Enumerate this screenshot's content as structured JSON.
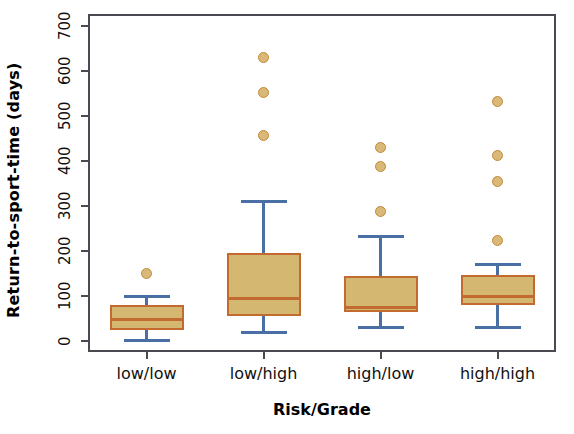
{
  "chart_data": {
    "type": "box",
    "title": "",
    "xlabel": "Risk/Grade",
    "ylabel": "Return-to-sport-time (days)",
    "ylim": [
      0,
      700
    ],
    "yticks": [
      0,
      100,
      200,
      300,
      400,
      500,
      600,
      700
    ],
    "ytick_labels": [
      "0",
      "100",
      "200",
      "300",
      "400",
      "500",
      "600",
      "700"
    ],
    "grid": false,
    "legend": "none",
    "categories": [
      "low/low",
      "low/high",
      "high/low",
      "high/high"
    ],
    "boxes": [
      {
        "category": "low/low",
        "whisker_low": 2,
        "q1": 25,
        "median": 47,
        "q3": 80,
        "whisker_high": 98,
        "outliers": [
          150
        ]
      },
      {
        "category": "low/high",
        "whisker_low": 18,
        "q1": 55,
        "median": 95,
        "q3": 195,
        "whisker_high": 310,
        "outliers": [
          456,
          552,
          630
        ]
      },
      {
        "category": "high/low",
        "whisker_low": 31,
        "q1": 65,
        "median": 75,
        "q3": 145,
        "whisker_high": 233,
        "outliers": [
          287,
          387,
          430
        ]
      },
      {
        "category": "high/high",
        "whisker_low": 31,
        "q1": 80,
        "median": 98,
        "q3": 147,
        "whisker_high": 170,
        "outliers": [
          224,
          355,
          413,
          533
        ]
      }
    ],
    "colors": {
      "box_fill": "#d4b872",
      "box_border": "#c26a30",
      "median": "#c26a30",
      "whisker": "#4a6fa5",
      "outlier_fill": "#d9b878",
      "outlier_border": "#c28b3c",
      "axis": "#4a4a52",
      "text": "#111111"
    }
  },
  "axes": {
    "y_title": "Return-to-sport-time (days)",
    "x_title": "Risk/Grade"
  }
}
